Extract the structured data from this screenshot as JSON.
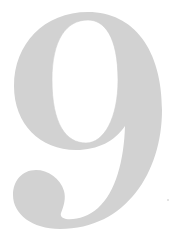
{
  "glyph": {
    "text": "9",
    "color": "#d2d2d2",
    "background": "#ffffff"
  }
}
